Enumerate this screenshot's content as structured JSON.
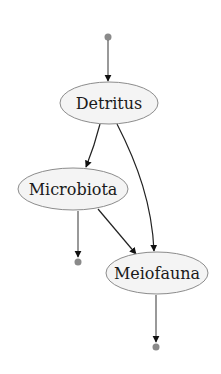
{
  "diagram": {
    "type": "directed-graph",
    "nodes": [
      {
        "id": "detritus",
        "label": "Detritus"
      },
      {
        "id": "microbiota",
        "label": "Microbiota"
      },
      {
        "id": "meiofauna",
        "label": "Meiofauna"
      }
    ],
    "edges": [
      {
        "from": "source",
        "to": "detritus"
      },
      {
        "from": "detritus",
        "to": "microbiota"
      },
      {
        "from": "detritus",
        "to": "meiofauna"
      },
      {
        "from": "microbiota",
        "to": "meiofauna"
      },
      {
        "from": "microbiota",
        "to": "sink-1"
      },
      {
        "from": "meiofauna",
        "to": "sink-2"
      }
    ],
    "colors": {
      "node_fill": "#f4f4f4",
      "node_stroke": "#8c8c8c",
      "edge": "#222222",
      "terminal_dot": "#8a8a8a"
    }
  }
}
